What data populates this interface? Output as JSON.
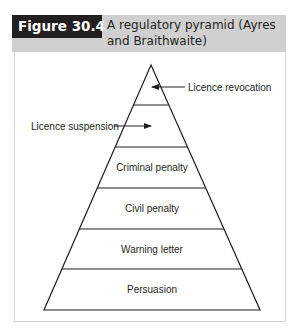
{
  "figure": {
    "number_label": "Figure 30.4",
    "title": "A regulatory pyramid (Ayres and Braithwaite)"
  },
  "pyramid": {
    "levels_top_to_bottom": [
      "Licence revocation",
      "Licence suspension",
      "Criminal penalty",
      "Civil penalty",
      "Warning letter",
      "Persuasion"
    ],
    "callouts": {
      "revocation": "Licence revocation",
      "suspension": "Licence suspension"
    },
    "inner_labels": {
      "criminal": "Criminal penalty",
      "civil": "Civil penalty",
      "warning": "Warning letter",
      "persuasion": "Persuasion"
    }
  },
  "colors": {
    "header_band": "#d0d0d0",
    "figure_label_bg": "#231f20",
    "line": "#231f20"
  }
}
